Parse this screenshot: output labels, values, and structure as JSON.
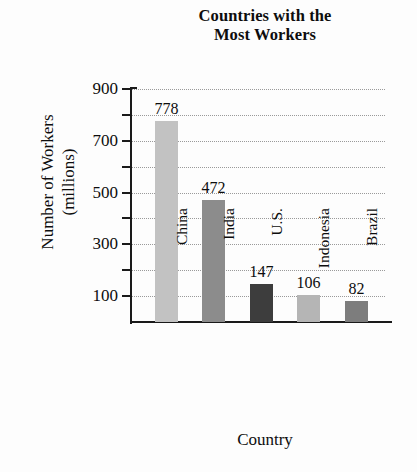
{
  "chart_data": {
    "type": "bar",
    "title": "Countries with the Most Workers",
    "title_lines": [
      "Countries with the",
      "Most Workers"
    ],
    "xlabel": "Country",
    "ylabel": "Number of Workers (millions)",
    "ylabel_lines": [
      "Number of Workers",
      "(millions)"
    ],
    "categories": [
      "China",
      "India",
      "U.S.",
      "Indonesia",
      "Brazil"
    ],
    "values": [
      778,
      472,
      147,
      106,
      82
    ],
    "value_labels": [
      "778",
      "472",
      "147",
      "106",
      "82"
    ],
    "bar_colors": [
      "#c2c2c2",
      "#8c8c8c",
      "#3d3d3d",
      "#b5b5b5",
      "#7d7d7d"
    ],
    "ylim": [
      0,
      900
    ],
    "ytick_values": [
      100,
      200,
      300,
      400,
      500,
      600,
      700,
      800,
      900
    ],
    "ytick_labels_shown": [
      "900",
      "700",
      "500",
      "300",
      "100"
    ],
    "ytick_label_values": [
      900,
      700,
      500,
      300,
      100
    ],
    "grid": true,
    "grid_style": "dotted",
    "grid_color": "#9a9a9a",
    "legend": "none",
    "axis_color": "#1a1a1a",
    "text_color": "#0d0d0d",
    "background": "#fdfdfd"
  }
}
